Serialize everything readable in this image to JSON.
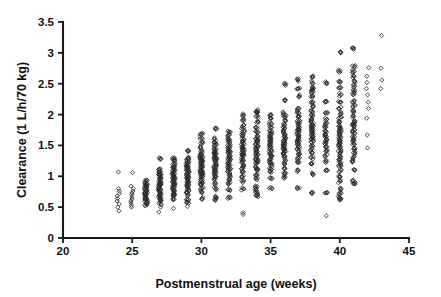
{
  "figure": {
    "title": "",
    "background_color": "#ffffff",
    "axis_color": "#1a1a1a",
    "marker_color": "#2b2b2b"
  },
  "chart_data": {
    "type": "scatter",
    "title": "",
    "xlabel": "Postmenstrual age (weeks)",
    "ylabel": "Clearance (1 L/h/70 kg)",
    "xlim": [
      20,
      45
    ],
    "ylim": [
      0,
      3.5
    ],
    "xticks": [
      20,
      25,
      30,
      35,
      40,
      45
    ],
    "xtick_labels": [
      "20",
      "25",
      "30",
      "35",
      "40",
      "45"
    ],
    "yticks": [
      0,
      0.5,
      1,
      1.5,
      2,
      2.5,
      3,
      3.5
    ],
    "ytick_labels": [
      "0",
      "0.5",
      "1",
      "1.5",
      "2",
      "2.5",
      "3",
      "3.5"
    ],
    "grid": false,
    "legend": null,
    "marker": "open-diamond",
    "marker_size": 4,
    "series": [
      {
        "name": "Individual clearance estimates",
        "columns": [
          {
            "x": 24,
            "values": [
              0.44,
              0.5,
              0.55,
              0.6,
              0.64,
              0.68,
              0.72,
              0.76,
              0.8,
              1.07
            ]
          },
          {
            "x": 25,
            "values": [
              0.5,
              0.53,
              0.57,
              0.6,
              0.63,
              0.66,
              0.7,
              0.73,
              0.76,
              0.8,
              0.84,
              1.06
            ]
          },
          {
            "x": 26,
            "values": [
              0.52,
              0.56,
              0.59,
              0.62,
              0.65,
              0.68,
              0.71,
              0.74,
              0.77,
              0.8,
              0.83,
              0.86,
              0.89,
              0.92
            ]
          },
          {
            "x": 27,
            "values": [
              0.42,
              0.5,
              0.56,
              0.6,
              0.64,
              0.68,
              0.71,
              0.74,
              0.77,
              0.8,
              0.83,
              0.86,
              0.89,
              0.92,
              0.95,
              0.98,
              1.01,
              1.04,
              1.07,
              1.11,
              1.29
            ]
          },
          {
            "x": 28,
            "values": [
              0.48,
              0.62,
              0.68,
              0.72,
              0.76,
              0.79,
              0.82,
              0.85,
              0.88,
              0.91,
              0.94,
              0.97,
              1.0,
              1.03,
              1.06,
              1.09,
              1.12,
              1.16,
              1.2,
              1.25,
              1.29
            ]
          },
          {
            "x": 29,
            "values": [
              0.51,
              0.58,
              0.62,
              0.7,
              0.76,
              0.8,
              0.84,
              0.88,
              0.91,
              0.94,
              0.97,
              1.0,
              1.03,
              1.06,
              1.09,
              1.12,
              1.15,
              1.18,
              1.22,
              1.26,
              1.3,
              1.42
            ]
          },
          {
            "x": 30,
            "values": [
              0.64,
              0.74,
              0.8,
              0.86,
              0.9,
              0.94,
              0.98,
              1.02,
              1.05,
              1.08,
              1.11,
              1.14,
              1.17,
              1.2,
              1.23,
              1.26,
              1.29,
              1.32,
              1.36,
              1.41,
              1.48,
              1.55,
              1.62,
              1.68
            ]
          },
          {
            "x": 31,
            "values": [
              0.62,
              0.66,
              0.8,
              0.88,
              0.94,
              1.0,
              1.04,
              1.08,
              1.12,
              1.16,
              1.2,
              1.23,
              1.26,
              1.29,
              1.32,
              1.35,
              1.38,
              1.41,
              1.45,
              1.5,
              1.55,
              1.6,
              1.78
            ]
          },
          {
            "x": 32,
            "values": [
              0.65,
              0.78,
              0.88,
              0.95,
              1.0,
              1.05,
              1.1,
              1.14,
              1.18,
              1.22,
              1.26,
              1.3,
              1.34,
              1.38,
              1.42,
              1.46,
              1.5,
              1.55,
              1.6,
              1.66,
              1.72
            ]
          },
          {
            "x": 33,
            "values": [
              0.38,
              0.41,
              0.8,
              0.92,
              1.0,
              1.07,
              1.13,
              1.18,
              1.23,
              1.28,
              1.32,
              1.36,
              1.4,
              1.44,
              1.48,
              1.52,
              1.56,
              1.6,
              1.65,
              1.7,
              1.76,
              1.83,
              1.92,
              1.99
            ]
          },
          {
            "x": 34,
            "values": [
              0.68,
              0.72,
              0.79,
              0.82,
              0.96,
              1.04,
              1.1,
              1.15,
              1.2,
              1.25,
              1.29,
              1.33,
              1.37,
              1.41,
              1.45,
              1.49,
              1.53,
              1.57,
              1.61,
              1.66,
              1.72,
              1.79,
              1.88,
              1.97,
              2.04,
              2.06
            ]
          },
          {
            "x": 35,
            "values": [
              0.82,
              0.98,
              1.06,
              1.12,
              1.18,
              1.23,
              1.28,
              1.32,
              1.36,
              1.4,
              1.44,
              1.48,
              1.52,
              1.56,
              1.6,
              1.64,
              1.68,
              1.73,
              1.79,
              1.86,
              1.94,
              2.0
            ]
          },
          {
            "x": 36,
            "values": [
              0.98,
              1.06,
              1.14,
              1.2,
              1.26,
              1.31,
              1.36,
              1.4,
              1.44,
              1.48,
              1.52,
              1.56,
              1.6,
              1.64,
              1.68,
              1.73,
              1.78,
              1.84,
              1.91,
              1.98,
              2.02,
              2.22,
              2.49
            ]
          },
          {
            "x": 37,
            "values": [
              0.8,
              1.1,
              1.22,
              1.3,
              1.36,
              1.42,
              1.47,
              1.52,
              1.56,
              1.6,
              1.64,
              1.68,
              1.72,
              1.76,
              1.8,
              1.85,
              1.9,
              1.96,
              2.03,
              2.1,
              2.3,
              2.42,
              2.56
            ]
          },
          {
            "x": 38,
            "values": [
              0.73,
              1.04,
              1.2,
              1.3,
              1.38,
              1.44,
              1.5,
              1.55,
              1.6,
              1.64,
              1.68,
              1.72,
              1.76,
              1.8,
              1.84,
              1.88,
              1.93,
              1.99,
              2.05,
              2.12,
              2.2,
              2.3,
              2.36,
              2.4,
              2.44,
              2.52,
              2.62
            ]
          },
          {
            "x": 39,
            "values": [
              0.36,
              0.74,
              1.1,
              1.24,
              1.34,
              1.42,
              1.48,
              1.54,
              1.59,
              1.64,
              1.69,
              1.74,
              1.79,
              1.85,
              1.92,
              2.02,
              2.2,
              2.51
            ]
          },
          {
            "x": 40,
            "values": [
              0.62,
              0.66,
              0.72,
              0.8,
              0.92,
              1.0,
              1.08,
              1.16,
              1.22,
              1.28,
              1.33,
              1.38,
              1.43,
              1.48,
              1.52,
              1.56,
              1.6,
              1.64,
              1.68,
              1.72,
              1.77,
              1.82,
              1.88,
              1.95,
              2.02,
              2.1,
              2.2,
              2.32,
              2.44,
              2.52,
              2.7,
              3.0
            ]
          },
          {
            "x": 41,
            "values": [
              0.88,
              0.92,
              1.1,
              1.24,
              1.3,
              1.38,
              1.46,
              1.52,
              1.58,
              1.64,
              1.7,
              1.76,
              1.8,
              1.84,
              1.9,
              1.98,
              2.06,
              2.14,
              2.22,
              2.32,
              2.38,
              2.46,
              2.54,
              2.62,
              2.7,
              2.78,
              3.08
            ]
          },
          {
            "x": 42,
            "values": [
              1.46,
              1.67,
              1.94,
              2.1,
              2.2,
              2.32,
              2.42,
              2.52,
              2.62,
              2.76
            ]
          },
          {
            "x": 43,
            "values": [
              2.42,
              2.56,
              2.75,
              3.28
            ]
          }
        ]
      }
    ]
  }
}
